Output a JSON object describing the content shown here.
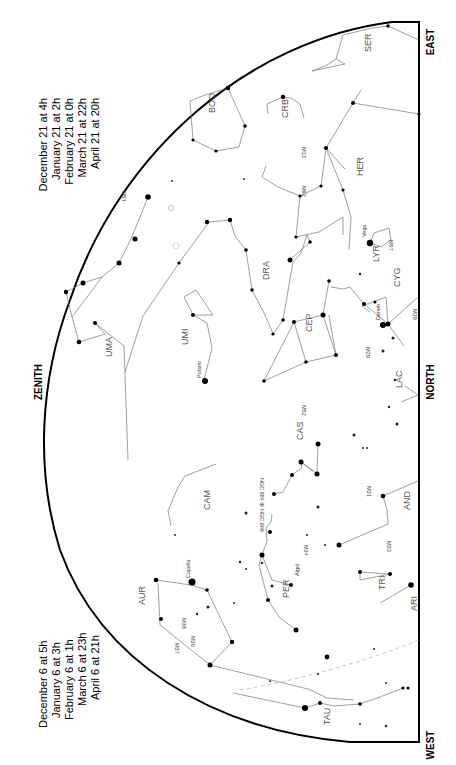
{
  "chart_title": "Northern sky star chart (rotated)",
  "directions": {
    "east": "EAST",
    "north": "NORTH",
    "west": "WEST",
    "zenith": "ZENITH"
  },
  "times_top": [
    "December 21 at  4h",
    "January 21 at  2h",
    "February 21 at  0h",
    "March 21 at 22h",
    "April 21 at 20h"
  ],
  "times_bottom": [
    "December 6 at  5h",
    "January 6 at  3h",
    "February 6 at  1h",
    "March 6 at 23h",
    "April 6 at 21h"
  ],
  "constellations": {
    "ser": "SER",
    "boo": "BOO",
    "crb": "CRB",
    "her": "HER",
    "uma": "UMA",
    "dra": "DRA",
    "umi": "UMI",
    "lyr": "LYR",
    "cyg": "CYG",
    "cep": "CEP",
    "lac": "LAC",
    "cas": "CAS",
    "cam": "CAM",
    "and": "AND",
    "per": "PER",
    "tri": "TRI",
    "aur": "AUR",
    "ari": "ARI",
    "tau": "TAU",
    "lac2": ""
  },
  "objects": {
    "m13": "M13",
    "m92": "M92",
    "m51": "M51",
    "m57": "M57",
    "m39": "M39",
    "m29": "M29",
    "m52": "M52",
    "ngc": "NGC 884 ⊕ NGC 869",
    "m31": "M31",
    "m33": "M33",
    "m34": "M34",
    "m36": "M36",
    "m37": "M37",
    "m38": "M38"
  },
  "stars": {
    "vega": "Vega",
    "deneb": "Deneb",
    "polaris": "Polaris",
    "capella": "Capella",
    "algol": "Algol",
    "aldebaran": "Ald"
  }
}
